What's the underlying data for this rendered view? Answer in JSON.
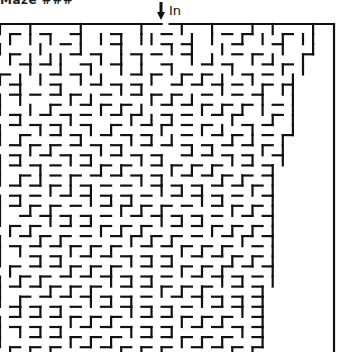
{
  "title": "Maze ###",
  "entrance": {
    "label": "In",
    "icon": "down-arrow-icon"
  },
  "colors": {
    "wall": "#111111",
    "background": "#ffffff"
  },
  "maze": {
    "origin_x": 0,
    "origin_y": 24,
    "cell": 10.1,
    "cols": 33,
    "rows": 33,
    "right_border_x": 334,
    "entrance_col": 16,
    "rows_data": [
      "|_ |_  _|  _  | _ |  |_ _| |_  |",
      " | | |_ | |_| ||_ _| | _| |_| ||",
      "|_  |  _|_  |_ _ |_|  |_ _  | _|",
      " |_|_|| _ |_| | _  |_|_  |_|_ |",
      "_  | _|_ |  |_|_ |_ _  |_ _ | |",
      "|_| |_  |_|_ _ | _|_|_|_ |_ _|",
      " _|_ _|_  _ |_|_ _  _ |_ _| ||",
      "| |  _ |_|_ _  |_|_|_ _ _ |_ |",
      "|_ |_|_ _ |_|_| _ _ |_|_| |_ |",
      " _|_ _ |_  _ |_|_|_ _  |_ _| |",
      "| _ |_|_ |_|_ _ | _ |_|_ |_ _|",
      "|_|_ _ _|_ _ |_|_|_ _ _|_|_ |",
      " _ |_|_ _ |_|_ _  _|_|_ _ |_|",
      "|_|_ _ |_|_ _ |_|_ _ _ |_|_ |",
      "| _ |_ _ _|_|_ _ |_|_|_ _ _|",
      "|_|_|_ |_ _ _ |_|_ _ _|_|_ |",
      " _ _ |_|_|_ _ _ |_|_|_ _ |_|",
      "|_|_ _ _ |_|_|_ _ _ |_|_ _ |",
      "| _|_|_ _ _ |_|_|_ _ _ |_|_|",
      "|_ _ |_|_|_ _ _ |_|_|_ _ _ |",
      " |_|_ _ _ |_|_|_ _ _ |_|_|_|",
      "|_ _|_|_ _ _ |_|_|_ _ _ |_ |",
      "| |_ _ |_|_|_ _ _ |_|_|_ _ |",
      "|_ _|_|_ _ _ |_|_|_ _ _|_|_|",
      " |_ _ _|_|_|_ _ _ |_|_|_ _ |",
      "|_|_|_ _ _ |_|_|_ _ _ |_|_ |",
      "| _ _|_|_|_ _ _ |_|_|_ _ _|",
      "|_|_ _ _ |_|_|_ _ _ |_|_|_|",
      " _|_|_|_ _ _ |_|_|_ _ _ |_|",
      "|_ _ _ |_|_|_ _ _ |_|_|_ _|",
      "| |_|_|_ _ _ |_|_|_ _ _ |_|",
      "|_ _ _ |_|_|_ _ _ |_|_|_ _|",
      " |_|_|_ _ _ |_|_|_ _ _ |_|_"
    ]
  }
}
